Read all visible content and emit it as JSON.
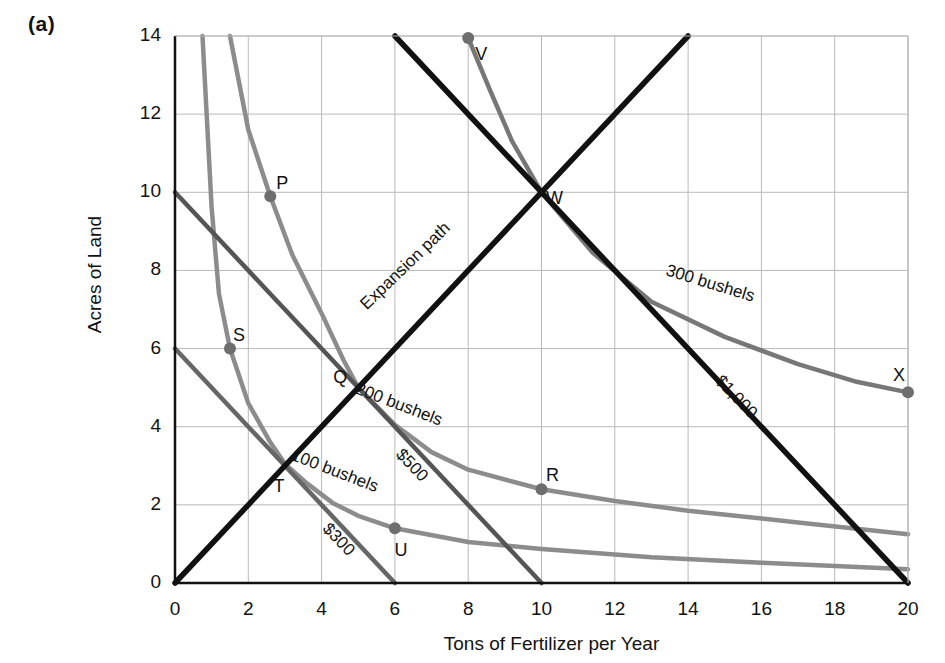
{
  "panel": {
    "label": "(a)"
  },
  "chart_data": {
    "type": "line",
    "title": "",
    "xlabel": "Tons of Fertilizer per Year",
    "ylabel": "Acres of Land",
    "xlim": [
      0,
      20
    ],
    "ylim": [
      0,
      14
    ],
    "grid": true,
    "xticks": [
      0,
      2,
      4,
      6,
      8,
      10,
      12,
      14,
      16,
      18,
      20
    ],
    "xtick_labels": [
      "0",
      "2",
      "4",
      "6",
      "8",
      "10",
      "12",
      "14",
      "16",
      "18",
      "20"
    ],
    "yticks": [
      0,
      2,
      4,
      6,
      8,
      10,
      12,
      14
    ],
    "ytick_labels": [
      "0",
      "2",
      "4",
      "6",
      "8",
      "10",
      "12",
      "14"
    ],
    "legend_position": "inline-curve-labels",
    "series": [
      {
        "name": "100 bushels",
        "kind": "isoquant",
        "color": "#8c8c8c",
        "label": "100 bushels",
        "label_x": 4.35,
        "label_y": 2.85,
        "label_rotate": 21,
        "points": [
          [
            0.75,
            14.0
          ],
          [
            1.0,
            9.6
          ],
          [
            1.2,
            7.4
          ],
          [
            1.5,
            6.0
          ],
          [
            2.0,
            4.6
          ],
          [
            2.6,
            3.6
          ],
          [
            3.0,
            3.05
          ],
          [
            3.6,
            2.55
          ],
          [
            4.3,
            2.05
          ],
          [
            5.0,
            1.72
          ],
          [
            6.0,
            1.4
          ],
          [
            8.0,
            1.05
          ],
          [
            10.0,
            0.87
          ],
          [
            13.0,
            0.66
          ],
          [
            16.0,
            0.52
          ],
          [
            20.0,
            0.35
          ]
        ]
      },
      {
        "name": "200 bushels",
        "kind": "isoquant",
        "color": "#8c8c8c",
        "label": "200 bushels",
        "label_x": 6.1,
        "label_y": 4.55,
        "label_rotate": 21,
        "points": [
          [
            1.5,
            14.0
          ],
          [
            2.0,
            11.6
          ],
          [
            2.6,
            9.9
          ],
          [
            3.2,
            8.4
          ],
          [
            4.0,
            6.9
          ],
          [
            4.6,
            5.7
          ],
          [
            5.0,
            5.0
          ],
          [
            6.0,
            4.05
          ],
          [
            7.0,
            3.35
          ],
          [
            8.0,
            2.9
          ],
          [
            10.0,
            2.4
          ],
          [
            12.0,
            2.1
          ],
          [
            14.0,
            1.85
          ],
          [
            17.0,
            1.55
          ],
          [
            20.0,
            1.25
          ]
        ]
      },
      {
        "name": "300 bushels",
        "kind": "isoquant",
        "color": "#777777",
        "label": "300 bushels",
        "label_x": 14.6,
        "label_y": 7.65,
        "label_rotate": 17,
        "points": [
          [
            8.0,
            13.95
          ],
          [
            8.6,
            12.6
          ],
          [
            9.2,
            11.3
          ],
          [
            10.0,
            10.0
          ],
          [
            11.4,
            8.45
          ],
          [
            13.0,
            7.2
          ],
          [
            15.0,
            6.3
          ],
          [
            17.0,
            5.6
          ],
          [
            18.6,
            5.15
          ],
          [
            20.0,
            4.88
          ]
        ]
      },
      {
        "name": "$300",
        "kind": "isocost",
        "color": "#666666",
        "label": "$300",
        "label_x": 4.45,
        "label_y": 1.1,
        "label_rotate": 46,
        "points": [
          [
            0,
            6
          ],
          [
            6,
            0
          ]
        ]
      },
      {
        "name": "$500",
        "kind": "isocost",
        "color": "#555555",
        "label": "$500",
        "label_x": 6.45,
        "label_y": 3.0,
        "label_rotate": 46,
        "points": [
          [
            0,
            10
          ],
          [
            10,
            0
          ]
        ]
      },
      {
        "name": "$1,000",
        "kind": "isocost",
        "color": "#111111",
        "label": "$1,000",
        "label_x": 15.3,
        "label_y": 4.75,
        "label_rotate": 46,
        "points": [
          [
            6,
            14
          ],
          [
            20,
            0
          ]
        ]
      },
      {
        "name": "Expansion path",
        "kind": "path",
        "color": "#111111",
        "label": "Expansion path",
        "label_x": 6.3,
        "label_y": 8.1,
        "label_rotate": -44,
        "points": [
          [
            0,
            0
          ],
          [
            14,
            14
          ]
        ]
      }
    ],
    "points": [
      {
        "name": "P",
        "x": 2.6,
        "y": 9.9,
        "label": "P",
        "label_dx": 12,
        "label_dy": -12,
        "dot": true
      },
      {
        "name": "Q",
        "x": 5.0,
        "y": 5.0,
        "label": "Q",
        "label_dx": -18,
        "label_dy": -9,
        "dot": false
      },
      {
        "name": "R",
        "x": 10.0,
        "y": 2.4,
        "label": "R",
        "label_dx": 11,
        "label_dy": -13,
        "dot": true
      },
      {
        "name": "S",
        "x": 1.5,
        "y": 6.0,
        "label": "S",
        "label_dx": 9,
        "label_dy": -12,
        "dot": true
      },
      {
        "name": "T",
        "x": 3.0,
        "y": 3.0,
        "label": "T",
        "label_dx": -6,
        "label_dy": 21,
        "dot": false
      },
      {
        "name": "U",
        "x": 6.0,
        "y": 1.4,
        "label": "U",
        "label_dx": 6,
        "label_dy": 23,
        "dot": true
      },
      {
        "name": "V",
        "x": 8.0,
        "y": 13.95,
        "label": "V",
        "label_dx": 13,
        "label_dy": 17,
        "dot": true
      },
      {
        "name": "W",
        "x": 10.0,
        "y": 10.0,
        "label": "W",
        "label_dx": 13,
        "label_dy": 7,
        "dot": false
      },
      {
        "name": "X",
        "x": 20.0,
        "y": 4.88,
        "label": "X",
        "label_dx": -9,
        "label_dy": -16,
        "dot": true
      }
    ],
    "colors": {
      "axis": "#111111",
      "grid": "#b9b9b9",
      "isoquant": "#8c8c8c",
      "isocost_light": "#666666",
      "isocost_dark": "#111111",
      "text": "#111111"
    }
  }
}
